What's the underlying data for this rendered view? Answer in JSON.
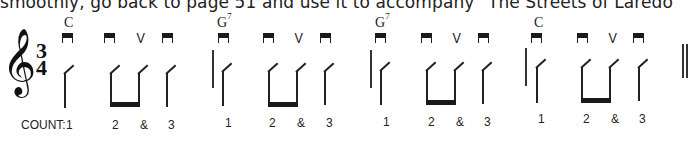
{
  "intro_text": "smoothly, go back to page 51 and use it to accompany \"The Streets of Laredo\"",
  "time_signature": {
    "top": "3",
    "bottom": "4"
  },
  "clef": "treble-clef",
  "count_label": "COUNT:",
  "measures": [
    {
      "chord": "C",
      "chord_sup": "",
      "strokes": [
        "down",
        "down",
        "up",
        "down"
      ],
      "counts": [
        "1",
        "2",
        "&",
        "3"
      ]
    },
    {
      "chord": "G",
      "chord_sup": "7",
      "strokes": [
        "down",
        "down",
        "up",
        "down"
      ],
      "counts": [
        "1",
        "2",
        "&",
        "3"
      ]
    },
    {
      "chord": "G",
      "chord_sup": "7",
      "strokes": [
        "down",
        "down",
        "up",
        "down"
      ],
      "counts": [
        "1",
        "2",
        "&",
        "3"
      ]
    },
    {
      "chord": "C",
      "chord_sup": "",
      "strokes": [
        "down",
        "down",
        "up",
        "down"
      ],
      "counts": [
        "1",
        "2",
        "&",
        "3"
      ]
    }
  ],
  "symbols": {
    "down_stroke": "down-bow-icon",
    "up_stroke": "V",
    "final_barline": "double-barline"
  }
}
